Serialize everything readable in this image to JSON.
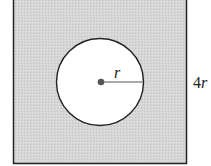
{
  "diagram": {
    "square": {
      "side_label": "4r",
      "fill": "#d4d4d4",
      "stroke": "#222222"
    },
    "circle": {
      "radius_label": "r",
      "fill": "#ffffff",
      "stroke": "#222222"
    },
    "center_dot_color": "#555555"
  }
}
